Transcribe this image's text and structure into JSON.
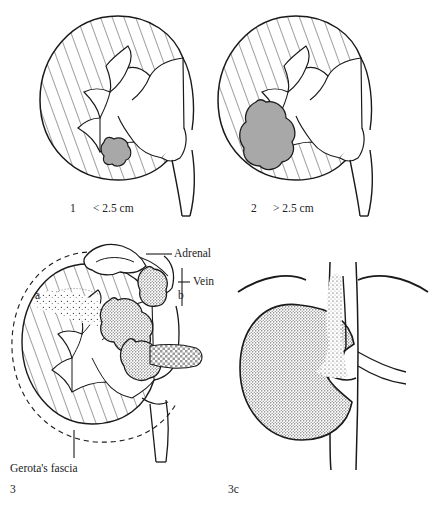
{
  "figure": {
    "title_visible": false,
    "background_color": "#ffffff",
    "ink_color": "#1a1a1a",
    "tumor_fill_color": "#a8a8a8",
    "stipple_color": "#3a3a3a"
  },
  "panels": [
    {
      "id": "panel-1",
      "number": "1",
      "size_label": "< 2.5 cm",
      "description": "hatched kidney with small tumor"
    },
    {
      "id": "panel-2",
      "number": "2",
      "size_label": "> 2.5 cm",
      "description": "hatched kidney with large tumor"
    },
    {
      "id": "panel-3",
      "number": "3",
      "description": "kidney with perinephric fat and vein invasion"
    },
    {
      "id": "panel-3c",
      "number": "3c",
      "description": "kidney with tumor thrombus above diaphragm"
    }
  ],
  "annotations": {
    "adrenal": "Adrenal",
    "vein": "Vein",
    "marker_a": "a",
    "marker_b": "b",
    "gerotas_fascia": "Gerota's fascia"
  }
}
